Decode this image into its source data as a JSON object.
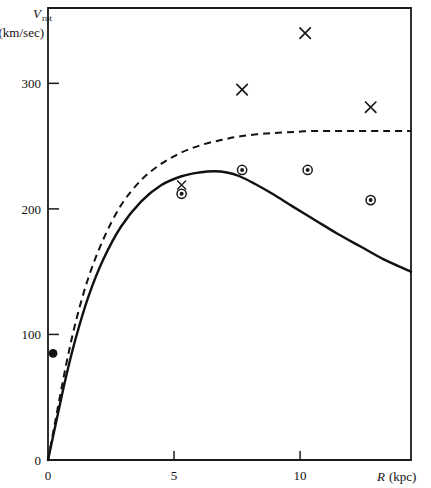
{
  "chart_data": {
    "type": "scatter",
    "title": "",
    "xlabel": "R (kpc)",
    "ylabel": "V_rot (km/sec)",
    "ylabel_main": "V",
    "ylabel_sub": "rot",
    "ylabel_units": "(km/sec)",
    "xlabel_symbol": "R",
    "xlabel_units": "(kpc)",
    "xlim": [
      0,
      14.4
    ],
    "ylim": [
      0,
      360
    ],
    "xticks": [
      0,
      5,
      10
    ],
    "xticklabels": [
      "0",
      "5",
      "10"
    ],
    "yticks": [
      0,
      100,
      200,
      300
    ],
    "yticklabels": [
      "0",
      "100",
      "200",
      "300"
    ],
    "grid": false,
    "legend": "none",
    "series": [
      {
        "name": "observed-crosses",
        "marker": "x",
        "x": [
          7.7,
          10.2,
          12.8
        ],
        "y": [
          295,
          340,
          281
        ]
      },
      {
        "name": "observed-circled-dots",
        "marker": "circled-dot",
        "x": [
          5.3,
          7.7,
          10.3,
          12.8
        ],
        "y": [
          212,
          231,
          231,
          207
        ]
      },
      {
        "name": "inner-cross",
        "marker": "x-small",
        "x": [
          5.3
        ],
        "y": [
          219
        ]
      },
      {
        "name": "inner-filled-dot",
        "marker": "filled-circle",
        "x": [
          0.2
        ],
        "y": [
          85
        ]
      },
      {
        "name": "model-solid-curve",
        "marker": "line-solid",
        "x": [
          0.0,
          0.3,
          0.7,
          1.1,
          1.6,
          2.2,
          2.9,
          3.7,
          4.5,
          5.3,
          6.0,
          6.6,
          7.1,
          7.6,
          8.2,
          8.9,
          9.7,
          10.6,
          11.5,
          12.4,
          13.3,
          14.4
        ],
        "y": [
          0,
          28,
          65,
          97,
          130,
          160,
          186,
          206,
          219,
          226,
          229,
          230,
          229,
          226,
          220,
          212,
          202,
          191,
          180,
          170,
          160,
          150
        ]
      },
      {
        "name": "model-dashed-curve",
        "marker": "line-dashed",
        "x": [
          0.0,
          0.3,
          0.7,
          1.1,
          1.6,
          2.2,
          2.9,
          3.7,
          4.5,
          5.3,
          6.1,
          6.9,
          7.7,
          8.6,
          9.5,
          10.5,
          11.5,
          12.5,
          13.5,
          14.4
        ],
        "y": [
          0,
          32,
          74,
          110,
          145,
          176,
          203,
          223,
          236,
          245,
          251,
          255,
          258,
          260,
          261,
          262,
          262,
          262,
          262,
          262
        ]
      }
    ]
  }
}
